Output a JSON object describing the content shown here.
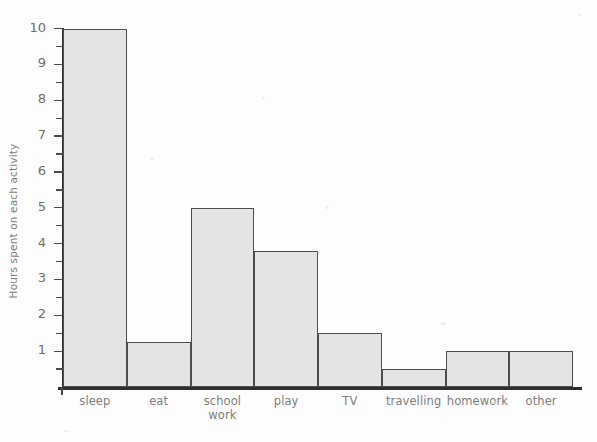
{
  "chart_data": {
    "type": "bar",
    "title": "",
    "xlabel": "",
    "ylabel": "Hours spent on each activity",
    "categories": [
      "sleep",
      "eat",
      "school work",
      "play",
      "TV",
      "travelling",
      "homework",
      "other"
    ],
    "values": [
      10,
      1.25,
      5,
      3.8,
      1.5,
      0.5,
      1,
      1
    ],
    "ylim": [
      0,
      10
    ],
    "xtick_labels": [
      "sleep",
      "eat",
      "school work",
      "play",
      "TV",
      "travelling",
      "homework",
      "other"
    ],
    "ytick_labels": [
      "1",
      "2",
      "3",
      "4",
      "5",
      "6",
      "7",
      "8",
      "9",
      "10"
    ],
    "ytick_values": [
      1,
      2,
      3,
      4,
      5,
      6,
      7,
      8,
      9,
      10
    ],
    "yminor_step": 0.5,
    "grid": false,
    "legend": null,
    "bar_gap": 0,
    "colors": {
      "bar_fill": "#e4e4e4",
      "bar_edge": "#4d4d4d",
      "axis": "#2e2e2e",
      "text": "#7d7d7d",
      "tick_text": "#6e6e6e",
      "background": "#fdfdfd"
    }
  },
  "axis": {
    "y_title": "Hours spent on each activity"
  },
  "categories_multiline": [
    {
      "line1": "sleep",
      "line2": ""
    },
    {
      "line1": "eat",
      "line2": ""
    },
    {
      "line1": "school",
      "line2": "work"
    },
    {
      "line1": "play",
      "line2": ""
    },
    {
      "line1": "TV",
      "line2": ""
    },
    {
      "line1": "travelling",
      "line2": ""
    },
    {
      "line1": "homework",
      "line2": ""
    },
    {
      "line1": "other",
      "line2": ""
    }
  ],
  "ytick_labels": {
    "t1": "1",
    "t2": "2",
    "t3": "3",
    "t4": "4",
    "t5": "5",
    "t6": "6",
    "t7": "7",
    "t8": "8",
    "t9": "9",
    "t10": "10"
  }
}
